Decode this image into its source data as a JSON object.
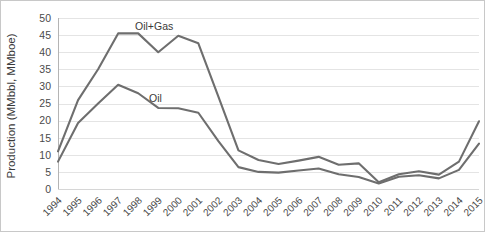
{
  "chart_data": {
    "type": "line",
    "title": "",
    "xlabel": "",
    "ylabel": "Production (MMbbl, MMboe)",
    "ylim": [
      0,
      50
    ],
    "yticks": [
      0,
      5,
      10,
      15,
      20,
      25,
      30,
      35,
      40,
      45,
      50
    ],
    "grid": true,
    "legend_position": "inline-annotation",
    "categories": [
      "1994",
      "1995",
      "1996",
      "1997",
      "1998",
      "1999",
      "2000",
      "2001",
      "2002",
      "2003",
      "2004",
      "2005",
      "2006",
      "2007",
      "2008",
      "2009",
      "2010",
      "2011",
      "2012",
      "2013",
      "2014",
      "2015"
    ],
    "series": [
      {
        "name": "Oil+Gas",
        "color": "#6e6e6e",
        "label_x_year": "1999",
        "values": [
          11.0,
          26.0,
          35.0,
          45.5,
          45.5,
          40.0,
          44.8,
          42.6,
          27.0,
          11.3,
          8.5,
          7.3,
          8.3,
          9.4,
          7.1,
          7.5,
          2.0,
          4.3,
          5.2,
          4.2,
          8.0,
          19.8
        ]
      },
      {
        "name": "Oil",
        "color": "#6e6e6e",
        "label_x_year": "2000",
        "values": [
          8.0,
          19.3,
          25.0,
          30.5,
          28.0,
          23.7,
          23.6,
          22.3,
          14.0,
          6.4,
          5.0,
          4.8,
          5.4,
          6.0,
          4.3,
          3.5,
          1.6,
          3.6,
          4.0,
          3.1,
          5.6,
          13.3
        ]
      }
    ],
    "annotations": [
      {
        "text": "Oil+Gas",
        "x_px": 134,
        "y_px": 29
      },
      {
        "text": "Oil",
        "x_px": 148,
        "y_px": 101
      }
    ]
  },
  "colors": {
    "series_line": "#6e6e6e",
    "gridline": "#e4e4e4",
    "text": "#4a4a4a",
    "border": "#c8c8c8",
    "background": "#ffffff"
  }
}
